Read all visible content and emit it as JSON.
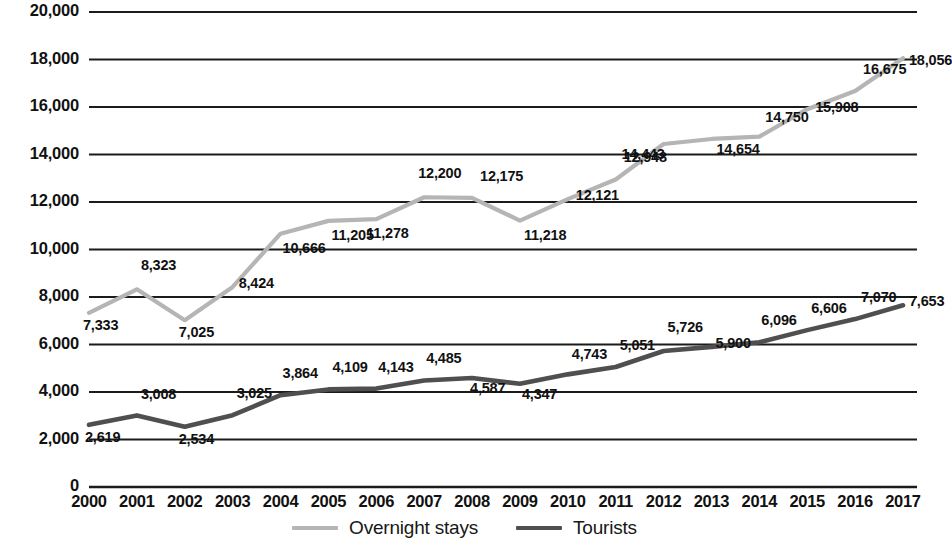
{
  "chart_data": {
    "type": "line",
    "title": "",
    "subtitle": "",
    "xlabel": "",
    "ylabel": "",
    "grid": true,
    "legend_position": "bottom",
    "ylim": [
      0,
      20000
    ],
    "ytick_step": 2000,
    "yticks": [
      "0",
      "2,000",
      "4,000",
      "6,000",
      "8,000",
      "10,000",
      "12,000",
      "14,000",
      "16,000",
      "18,000",
      "20,000"
    ],
    "categories": [
      "2000",
      "2001",
      "2002",
      "2003",
      "2004",
      "2005",
      "2006",
      "2007",
      "2008",
      "2009",
      "2010",
      "2011",
      "2012",
      "2013",
      "2014",
      "2015",
      "2016",
      "2017"
    ],
    "series": [
      {
        "name": "Overnight stays",
        "color": "#b5b5b5",
        "values": [
          7333,
          8323,
          7025,
          8424,
          10666,
          11205,
          11278,
          12200,
          12175,
          11218,
          12121,
          12948,
          14443,
          14654,
          14750,
          15908,
          16675,
          18056
        ],
        "labels": [
          "7,333",
          "8,323",
          "7,025",
          "8,424",
          "10,666",
          "11,205",
          "11,278",
          "12,200",
          "12,175",
          "11,218",
          "12,121",
          "12,948",
          "14,443",
          "14,654",
          "14,750",
          "15,908",
          "16,675",
          "18,056"
        ]
      },
      {
        "name": "Tourists",
        "color": "#4f4f4f",
        "values": [
          2619,
          3008,
          2534,
          3025,
          3864,
          4109,
          4143,
          4485,
          4587,
          4347,
          4743,
          5051,
          5726,
          5900,
          6096,
          6606,
          7070,
          7653
        ],
        "labels": [
          "2,619",
          "3,008",
          "2,534",
          "3,025",
          "3,864",
          "4,109",
          "4,143",
          "4,485",
          "4,587",
          "4,347",
          "4,743",
          "5,051",
          "5,726",
          "5,900",
          "6,096",
          "6,606",
          "7,070",
          "7,653"
        ]
      }
    ]
  },
  "legend": {
    "items": [
      {
        "label": "Overnight stays",
        "color": "#b5b5b5"
      },
      {
        "label": "Tourists",
        "color": "#4f4f4f"
      }
    ]
  }
}
